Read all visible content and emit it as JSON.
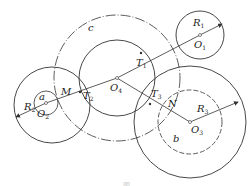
{
  "diagram": {
    "colors": {
      "stroke": "#333333",
      "background": "#ffffff"
    },
    "centers": {
      "O1": {
        "label": "O",
        "sub": "1",
        "x": 200,
        "y": 35
      },
      "O2": {
        "label": "O",
        "sub": "2",
        "x": 46,
        "y": 103
      },
      "O3": {
        "label": "O",
        "sub": "3",
        "x": 190,
        "y": 122
      },
      "O4": {
        "label": "O",
        "sub": "4",
        "x": 117,
        "y": 78
      }
    },
    "points": {
      "T1": {
        "label": "T",
        "sub": "1",
        "x": 141,
        "y": 53
      },
      "T2": {
        "label": "T",
        "sub": "2",
        "x": 80,
        "y": 92
      },
      "T3": {
        "label": "T",
        "sub": "3",
        "x": 150,
        "y": 104
      },
      "M": {
        "label": "M",
        "x": 58,
        "y": 99
      },
      "N": {
        "label": "N",
        "x": 167,
        "y": 111
      }
    },
    "circles": [
      {
        "name": "c",
        "cx": 117,
        "cy": 78,
        "r": 63,
        "style": "dash-dot",
        "label": "c"
      },
      {
        "name": "O4-solid",
        "cx": 117,
        "cy": 78,
        "r": 38,
        "style": "solid"
      },
      {
        "name": "R1",
        "cx": 200,
        "cy": 35,
        "r": 24,
        "style": "solid"
      },
      {
        "name": "a",
        "cx": 46,
        "cy": 103,
        "r": 12,
        "style": "solid",
        "label": "a"
      },
      {
        "name": "R2",
        "cx": 52,
        "cy": 105,
        "r": 38,
        "style": "solid"
      },
      {
        "name": "b",
        "cx": 190,
        "cy": 122,
        "r": 32,
        "style": "dashed",
        "label": "b"
      },
      {
        "name": "R3",
        "cx": 190,
        "cy": 122,
        "r": 56,
        "style": "solid"
      }
    ],
    "radius_labels": {
      "R1": {
        "label": "R",
        "sub": "1"
      },
      "R2": {
        "label": "R",
        "sub": "2"
      },
      "R3": {
        "label": "R",
        "sub": "3"
      }
    },
    "circle_labels": {
      "a": "a",
      "b": "b",
      "c": "c"
    },
    "caption": "图"
  }
}
